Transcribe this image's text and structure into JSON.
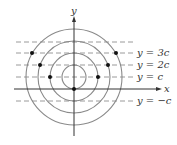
{
  "diagram": {
    "axes": {
      "x_label": "x",
      "y_label": "y"
    },
    "lines": [
      {
        "id": "top",
        "label": "",
        "y": 42
      },
      {
        "id": "y3c",
        "label": "y = 3c",
        "y": 53
      },
      {
        "id": "y2c",
        "label": "y = 2c",
        "y": 65
      },
      {
        "id": "yc",
        "label": "y = c",
        "y": 77
      },
      {
        "id": "ynegc",
        "label": "y = −c",
        "y": 101
      }
    ],
    "circles": {
      "center": [
        74,
        77
      ],
      "radii": [
        12,
        24,
        36,
        48
      ]
    },
    "points": [
      [
        32,
        53
      ],
      [
        116,
        53
      ],
      [
        40,
        65
      ],
      [
        108,
        65
      ],
      [
        50,
        77
      ],
      [
        98,
        77
      ],
      [
        74,
        89
      ]
    ],
    "colors": {
      "circle": "#8a8a8a",
      "dash": "#9a9a9a",
      "axis": "#333333",
      "dot": "#111111"
    }
  }
}
